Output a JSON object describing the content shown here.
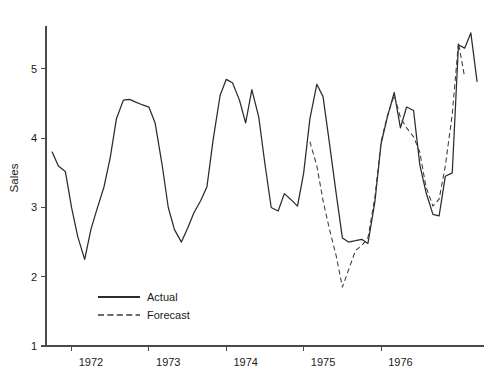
{
  "chart_data": {
    "type": "line",
    "title": "",
    "xlabel": "",
    "ylabel": "Sales",
    "xlim": [
      1971.42,
      1977.08
    ],
    "ylim": [
      1,
      5.62
    ],
    "grid": false,
    "legend_position": "inside-bottom-left",
    "x_tick_labels": [
      "1972",
      "1973",
      "1974",
      "1975",
      "1976"
    ],
    "x_tick_values": [
      1972,
      1973,
      1974,
      1975,
      1976
    ],
    "x_tick_mark_values": [
      1971.75,
      1972.75,
      1973.75,
      1974.75,
      1975.75
    ],
    "y_tick_labels": [
      "1",
      "2",
      "3",
      "4",
      "5"
    ],
    "y_tick_values": [
      1,
      2,
      3,
      4,
      5
    ],
    "series": [
      {
        "name": "Actual",
        "style": "solid",
        "color": "#2b2b2b",
        "x": [
          1971.5,
          1971.58,
          1971.67,
          1971.75,
          1971.83,
          1971.92,
          1972.0,
          1972.08,
          1972.17,
          1972.25,
          1972.33,
          1972.42,
          1972.5,
          1972.58,
          1972.67,
          1972.75,
          1972.83,
          1972.92,
          1973.0,
          1973.08,
          1973.17,
          1973.25,
          1973.33,
          1973.42,
          1973.5,
          1973.58,
          1973.67,
          1973.75,
          1973.83,
          1973.92,
          1974.0,
          1974.08,
          1974.17,
          1974.25,
          1974.33,
          1974.42,
          1974.5,
          1974.58,
          1974.67,
          1974.75,
          1974.83,
          1974.92,
          1975.0,
          1975.08,
          1975.17,
          1975.25,
          1975.33,
          1975.42,
          1975.5,
          1975.58,
          1975.67,
          1975.75,
          1975.83,
          1975.92,
          1976.0,
          1976.08,
          1976.17,
          1976.25,
          1976.33,
          1976.42,
          1976.5,
          1976.58,
          1976.67,
          1976.75,
          1976.83
        ],
        "y": [
          3.8,
          3.6,
          3.52,
          3.0,
          2.58,
          2.25,
          2.68,
          2.98,
          3.3,
          3.72,
          4.28,
          4.55,
          4.56,
          4.52,
          4.48,
          4.45,
          4.22,
          3.62,
          3.0,
          2.68,
          2.5,
          2.7,
          2.92,
          3.1,
          3.3,
          3.98,
          4.62,
          4.85,
          4.8,
          4.55,
          4.22,
          4.7,
          4.3,
          3.62,
          3.0,
          2.95,
          3.2,
          3.12,
          3.02,
          3.5,
          4.28,
          4.78,
          4.6,
          3.95,
          3.2,
          2.56,
          2.5,
          2.52,
          2.54,
          2.48,
          3.08,
          3.92,
          4.3,
          4.66,
          4.15,
          4.45,
          4.4,
          3.62,
          3.22,
          2.9,
          2.88,
          3.45,
          3.5,
          5.35,
          5.3
        ],
        "y_extra_tail": [
          5.52,
          4.82
        ]
      },
      {
        "name": "Forecast",
        "style": "dashed",
        "color": "#3a3a3a",
        "x": [
          1974.83,
          1974.92,
          1975.0,
          1975.08,
          1975.17,
          1975.25,
          1975.33,
          1975.42,
          1975.5,
          1975.58,
          1975.67,
          1975.75,
          1975.83,
          1975.92,
          1976.0,
          1976.08,
          1976.17,
          1976.25,
          1976.33,
          1976.42,
          1976.5,
          1976.58,
          1976.67,
          1976.75,
          1976.83
        ],
        "y": [
          3.95,
          3.6,
          3.1,
          2.7,
          2.3,
          1.85,
          2.1,
          2.38,
          2.45,
          2.56,
          3.15,
          3.95,
          4.32,
          4.62,
          4.3,
          4.15,
          4.02,
          3.8,
          3.3,
          3.02,
          3.12,
          3.6,
          4.35,
          5.38,
          4.88
        ]
      }
    ],
    "legend": [
      {
        "label": "Actual",
        "style": "solid",
        "color": "#2b2b2b"
      },
      {
        "label": "Forecast",
        "style": "dashed",
        "color": "#3a3a3a"
      }
    ]
  },
  "plot_geometry": {
    "left": 46,
    "right": 484,
    "top": 26,
    "bottom": 346
  }
}
